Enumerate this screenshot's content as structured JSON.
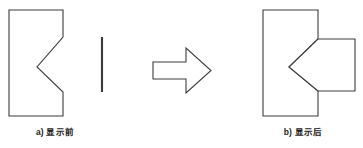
{
  "figure": {
    "background_color": "#ffffff",
    "stroke_color": "#3c3c3c",
    "fill_color": "#ffffff",
    "stroke_width": 1.1,
    "panels": [
      {
        "id": "panel-a",
        "caption": "a) 显示前",
        "description": "notched-rectangle-and-separate-line",
        "shapes": [
          {
            "name": "notched-rectangle",
            "type": "polygon",
            "points": "9,10 63,10 63,37 37,67 63,92 63,116 9,116"
          },
          {
            "name": "vertical-line",
            "type": "line",
            "x1": 102,
            "y1": 37,
            "x2": 102,
            "y2": 92
          }
        ]
      },
      {
        "id": "panel-arrow",
        "caption": "",
        "description": "right-pointing-block-arrow",
        "shapes": [
          {
            "name": "block-arrow",
            "type": "polygon",
            "points": "153,62 186,62 186,48 211,70.5 186,93 186,79 153,79"
          }
        ]
      },
      {
        "id": "panel-b",
        "caption": "b) 显示后",
        "description": "notched-rectangle-with-attached-wedge-block",
        "shapes": [
          {
            "name": "notched-rectangle",
            "type": "polygon",
            "points": "263,10 318,10 318,39 289,67 318,91 318,116 263,116"
          },
          {
            "name": "wedge-block",
            "type": "polygon",
            "points": "318,39 355,39 355,91 318,91 289,67"
          }
        ]
      }
    ]
  },
  "captions": {
    "left": "a) 显示前",
    "right": "b) 显示后"
  }
}
